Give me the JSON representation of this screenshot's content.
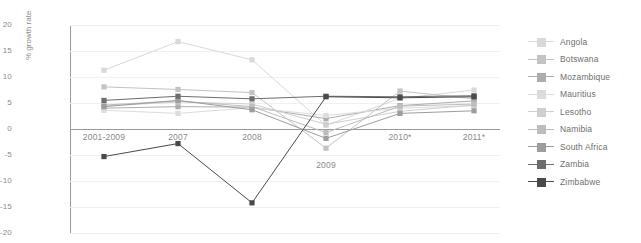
{
  "chart_data": {
    "type": "line",
    "title": "",
    "xlabel": "",
    "ylabel": "% growth rate",
    "categories": [
      "2001-2009",
      "2007",
      "2008",
      "2009",
      "2010*",
      "2011*"
    ],
    "ylim": [
      -20,
      20
    ],
    "yticks": [
      20,
      15,
      10,
      5,
      0,
      -5,
      -10,
      -15,
      -20
    ],
    "grid": true,
    "legend_position": "right",
    "series": [
      {
        "name": "Angola",
        "color": "#d9d9d9",
        "values": [
          11.3,
          16.8,
          13.3,
          0.7,
          5.9,
          7.5
        ]
      },
      {
        "name": "Botswana",
        "color": "#c3c3c3",
        "values": [
          8.1,
          7.6,
          7.0,
          -3.7,
          7.3,
          5.8
        ]
      },
      {
        "name": "Mozambique",
        "color": "#adadad",
        "values": [
          4.0,
          4.3,
          4.2,
          2.0,
          4.5,
          5.4
        ]
      },
      {
        "name": "Mauritius",
        "color": "#dcdcdc",
        "values": [
          3.6,
          3.0,
          4.1,
          2.6,
          4.0,
          4.5
        ]
      },
      {
        "name": "Lesotho",
        "color": "#cfcfcf",
        "values": [
          4.4,
          5.2,
          4.8,
          0.9,
          3.4,
          4.6
        ]
      },
      {
        "name": "Namibia",
        "color": "#bdbdbd",
        "values": [
          4.6,
          5.4,
          4.3,
          -0.7,
          4.4,
          4.8
        ]
      },
      {
        "name": "South Africa",
        "color": "#9d9d9d",
        "values": [
          4.3,
          5.5,
          3.7,
          -1.8,
          3.0,
          3.5
        ]
      },
      {
        "name": "Zambia",
        "color": "#6d6d6d",
        "values": [
          5.5,
          6.3,
          5.8,
          6.3,
          6.2,
          6.4
        ]
      },
      {
        "name": "Zimbabwe",
        "color": "#4a4a4a",
        "values": [
          -5.3,
          -2.8,
          -14.2,
          6.2,
          6.0,
          6.2
        ]
      }
    ]
  },
  "axis": {
    "y_ticks": [
      "20",
      "15",
      "10",
      "5",
      "0",
      "-5",
      "-10",
      "-15",
      "-20"
    ],
    "y_label": "% growth rate",
    "x_ticks": [
      "2001-2009",
      "2007",
      "2008",
      "2009",
      "2010*",
      "2011*"
    ]
  },
  "legend": {
    "items": [
      {
        "label": "Angola"
      },
      {
        "label": "Botswana"
      },
      {
        "label": "Mozambique"
      },
      {
        "label": "Mauritius"
      },
      {
        "label": "Lesotho"
      },
      {
        "label": "Namibia"
      },
      {
        "label": "South Africa"
      },
      {
        "label": "Zambia"
      },
      {
        "label": "Zimbabwe"
      }
    ]
  },
  "colors": {
    "grid": "#f0f0f0",
    "axis": "#9a9a9a",
    "text": "#8a8a8a"
  }
}
